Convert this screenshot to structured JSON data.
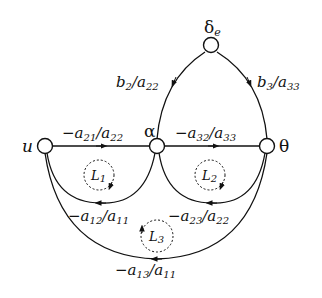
{
  "diagram": {
    "type": "signal-flow-graph",
    "nodes": {
      "delta_e": {
        "label": "δ",
        "sub": "e"
      },
      "u": {
        "label": "u"
      },
      "alpha": {
        "label": "α"
      },
      "theta": {
        "label": "θ"
      }
    },
    "edges": {
      "b2": {
        "num": "b",
        "num_sub": "2",
        "den": "a",
        "den_sub": "22",
        "from": "δe",
        "to": "α"
      },
      "b3": {
        "num": "b",
        "num_sub": "3",
        "den": "a",
        "den_sub": "33",
        "from": "δe",
        "to": "θ"
      },
      "a21": {
        "sign": "−",
        "num": "a",
        "num_sub": "21",
        "den": "a",
        "den_sub": "22",
        "from": "u",
        "to": "α"
      },
      "a32": {
        "sign": "−",
        "num": "a",
        "num_sub": "32",
        "den": "a",
        "den_sub": "33",
        "from": "α",
        "to": "θ"
      },
      "a12": {
        "sign": "−",
        "num": "a",
        "num_sub": "12",
        "den": "a",
        "den_sub": "11",
        "from": "α",
        "to": "u"
      },
      "a23": {
        "sign": "−",
        "num": "a",
        "num_sub": "23",
        "den": "a",
        "den_sub": "22",
        "from": "θ",
        "to": "α"
      },
      "a13": {
        "sign": "−",
        "num": "a",
        "num_sub": "13",
        "den": "a",
        "den_sub": "11",
        "from": "θ",
        "to": "u"
      }
    },
    "loops": {
      "L1": {
        "label": "L",
        "sub": "1"
      },
      "L2": {
        "label": "L",
        "sub": "2"
      },
      "L3": {
        "label": "L",
        "sub": "3"
      }
    },
    "colors": {
      "stroke": "#111111",
      "background": "#ffffff"
    }
  }
}
